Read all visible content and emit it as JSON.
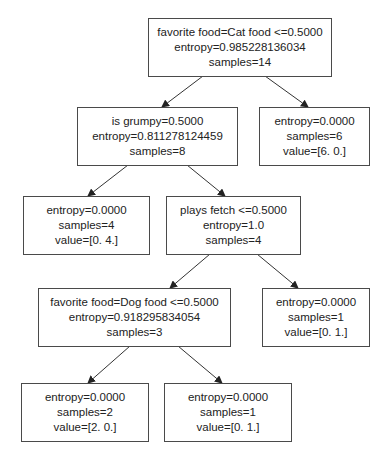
{
  "diagram": {
    "type": "decision-tree",
    "nodes": [
      {
        "id": "root",
        "lines": [
          "favorite food=Cat food <=0.5000",
          "entropy=0.985228136034",
          "samples=14"
        ]
      },
      {
        "id": "grumpy",
        "lines": [
          "is grumpy=0.5000",
          "entropy=0.811278124459",
          "samples=8"
        ]
      },
      {
        "id": "leaf_6_0",
        "lines": [
          "entropy=0.0000",
          "samples=6",
          "value=[6. 0.]"
        ]
      },
      {
        "id": "leaf_0_4",
        "lines": [
          "entropy=0.0000",
          "samples=4",
          "value=[0. 4.]"
        ]
      },
      {
        "id": "fetch",
        "lines": [
          "plays fetch <=0.5000",
          "entropy=1.0",
          "samples=4"
        ]
      },
      {
        "id": "dogfood",
        "lines": [
          "favorite food=Dog food <=0.5000",
          "entropy=0.918295834054",
          "samples=3"
        ]
      },
      {
        "id": "leaf_0_1_a",
        "lines": [
          "entropy=0.0000",
          "samples=1",
          "value=[0. 1.]"
        ]
      },
      {
        "id": "leaf_2_0",
        "lines": [
          "entropy=0.0000",
          "samples=2",
          "value=[2. 0.]"
        ]
      },
      {
        "id": "leaf_0_1_b",
        "lines": [
          "entropy=0.0000",
          "samples=1",
          "value=[0. 1.]"
        ]
      }
    ],
    "edges": [
      [
        "root",
        "grumpy"
      ],
      [
        "root",
        "leaf_6_0"
      ],
      [
        "grumpy",
        "leaf_0_4"
      ],
      [
        "grumpy",
        "fetch"
      ],
      [
        "fetch",
        "dogfood"
      ],
      [
        "fetch",
        "leaf_0_1_a"
      ],
      [
        "dogfood",
        "leaf_2_0"
      ],
      [
        "dogfood",
        "leaf_0_1_b"
      ]
    ],
    "colors": {
      "border": "#4a4a4a",
      "edge": "#333333",
      "text": "#222222",
      "background": "#ffffff"
    }
  }
}
